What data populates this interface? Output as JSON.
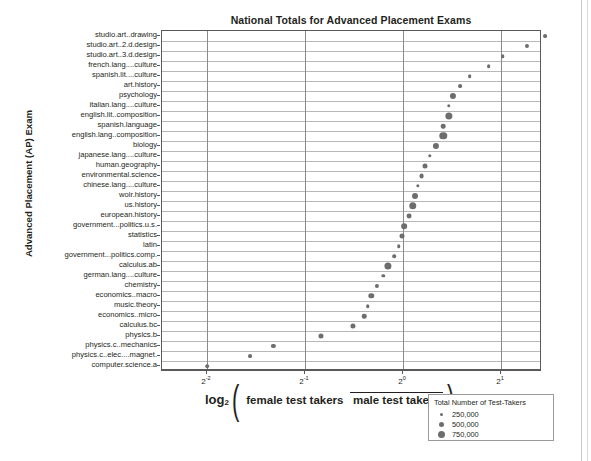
{
  "chart_data": {
    "type": "scatter",
    "title": "National Totals for Advanced Placement Exams",
    "xlabel_log": "log",
    "xlabel_sub": "2",
    "xlabel_numerator": "female test takers",
    "xlabel_denominator": "male test takers",
    "ylabel": "Advanced Placement (AP) Exam",
    "x_scale": "log2",
    "x_ticks": [
      {
        "label": "2",
        "exp": "-2",
        "value": 0.25
      },
      {
        "label": "2",
        "exp": "-1",
        "value": 0.5
      },
      {
        "label": "2",
        "exp": "0",
        "value": 1.0
      },
      {
        "label": "2",
        "exp": "1",
        "value": 2.0
      }
    ],
    "xlim": [
      0.182,
      2.67
    ],
    "grid": true,
    "legend": {
      "title": "Total Number of Test-Takers",
      "position": "bottom-right",
      "entries": [
        {
          "label": "250,000",
          "value": 250000,
          "size_px": 3.0
        },
        {
          "label": "500,000",
          "value": 500000,
          "size_px": 5.0
        },
        {
          "label": "750,000",
          "value": 750000,
          "size_px": 7.0
        }
      ]
    },
    "categories": [
      "studio.art..drawing",
      "studio.art..2.d.design",
      "studio.art..3.d.design",
      "french.lang....culture",
      "spanish.lit....culture",
      "art.history",
      "psychology",
      "italian.lang....culture",
      "english.lit..composition",
      "spanish.language",
      "english.lang..composition",
      "biology",
      "japanese.lang....culture",
      "human.geography",
      "environmental.science",
      "chinese.lang....culture",
      "wolr.history",
      "us.history",
      "european.history",
      "government...politics.u.s.",
      "statistics",
      "latin",
      "government...politics.comp.",
      "calculus.ab",
      "german.lang....culture",
      "chemistry",
      "economics..macro",
      "music.theory",
      "economics..micro",
      "calculus.bc",
      "physics.b",
      "physics.c..mechanics",
      "physics.c..elec....magnet.",
      "computer.science.a"
    ],
    "points": [
      {
        "category": "studio.art..drawing",
        "ratio": 2.72,
        "total": 90000
      },
      {
        "category": "studio.art..2.d.design",
        "ratio": 2.4,
        "total": 110000
      },
      {
        "category": "studio.art..3.d.design",
        "ratio": 2.02,
        "total": 60000
      },
      {
        "category": "french.lang....culture",
        "ratio": 1.83,
        "total": 75000
      },
      {
        "category": "spanish.lit....culture",
        "ratio": 1.6,
        "total": 70000
      },
      {
        "category": "art.history",
        "ratio": 1.5,
        "total": 80000
      },
      {
        "category": "psychology",
        "ratio": 1.42,
        "total": 430000
      },
      {
        "category": "italian.lang....culture",
        "ratio": 1.38,
        "total": 55000
      },
      {
        "category": "english.lit..composition",
        "ratio": 1.38,
        "total": 700000
      },
      {
        "category": "spanish.language",
        "ratio": 1.33,
        "total": 175000
      },
      {
        "category": "english.lang..composition",
        "ratio": 1.33,
        "total": 760000
      },
      {
        "category": "biology",
        "ratio": 1.26,
        "total": 450000
      },
      {
        "category": "japanese.lang....culture",
        "ratio": 1.21,
        "total": 50000
      },
      {
        "category": "human.geography",
        "ratio": 1.17,
        "total": 230000
      },
      {
        "category": "environmental.science",
        "ratio": 1.14,
        "total": 215000
      },
      {
        "category": "chinese.lang....culture",
        "ratio": 1.11,
        "total": 45000
      },
      {
        "category": "wolr.history",
        "ratio": 1.09,
        "total": 400000
      },
      {
        "category": "us.history",
        "ratio": 1.07,
        "total": 760000
      },
      {
        "category": "european.history",
        "ratio": 1.04,
        "total": 220000
      },
      {
        "category": "government...politics.u.s.",
        "ratio": 1.01,
        "total": 350000
      },
      {
        "category": "statistics",
        "ratio": 0.99,
        "total": 230000
      },
      {
        "category": "latin",
        "ratio": 0.97,
        "total": 60000
      },
      {
        "category": "government...politics.comp.",
        "ratio": 0.94,
        "total": 65000
      },
      {
        "category": "calculus.ab",
        "ratio": 0.9,
        "total": 680000
      },
      {
        "category": "german.lang....culture",
        "ratio": 0.87,
        "total": 50000
      },
      {
        "category": "chemistry",
        "ratio": 0.83,
        "total": 120000
      },
      {
        "category": "economics..macro",
        "ratio": 0.8,
        "total": 300000
      },
      {
        "category": "music.theory",
        "ratio": 0.78,
        "total": 60000
      },
      {
        "category": "economics..micro",
        "ratio": 0.76,
        "total": 160000
      },
      {
        "category": "calculus.bc",
        "ratio": 0.7,
        "total": 250000
      },
      {
        "category": "physics.b",
        "ratio": 0.56,
        "total": 240000
      },
      {
        "category": "physics.c..mechanics",
        "ratio": 0.4,
        "total": 130000
      },
      {
        "category": "physics.c..elec....magnet.",
        "ratio": 0.34,
        "total": 90000
      },
      {
        "category": "computer.science.a",
        "ratio": 0.25,
        "total": 70000
      }
    ]
  }
}
